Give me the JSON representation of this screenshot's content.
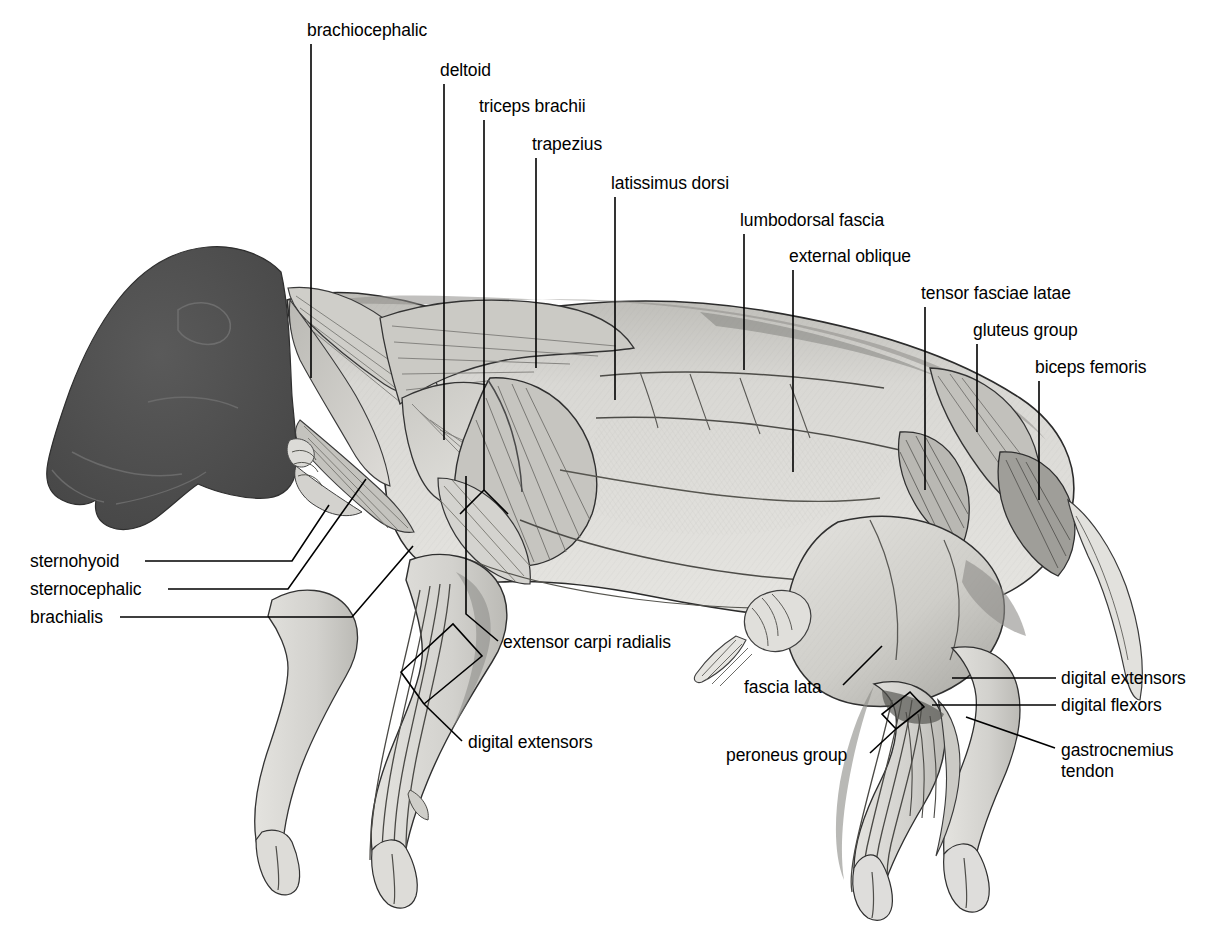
{
  "figure": {
    "kind": "anatomical-illustration",
    "background_color": "#ffffff",
    "ink_color": "#000000",
    "muscle_fill_color": "#d9d8d4",
    "muscle_shade_color": "#9a9894",
    "head_color": "#4e4e4e"
  },
  "labels": [
    {
      "id": "brachiocephalic",
      "text": "brachiocephalic",
      "x": 307,
      "y": 22,
      "leader": {
        "type": "vertical",
        "x": 311,
        "y1": 44,
        "y2": 378
      }
    },
    {
      "id": "deltoid",
      "text": "deltoid",
      "x": 440,
      "y": 62,
      "leader": {
        "type": "vertical",
        "x": 444,
        "y1": 84,
        "y2": 440
      }
    },
    {
      "id": "triceps-brachii",
      "text": "triceps brachii",
      "x": 479,
      "y": 98,
      "leader": {
        "type": "forked",
        "x": 484,
        "y1": 120,
        "y2": 490,
        "fork_dx": 20,
        "fork_dy": 22
      }
    },
    {
      "id": "trapezius",
      "text": "trapezius",
      "x": 532,
      "y": 136,
      "leader": {
        "type": "vertical",
        "x": 536,
        "y1": 158,
        "y2": 368
      }
    },
    {
      "id": "latissimus-dorsi",
      "text": "latissimus dorsi",
      "x": 611,
      "y": 175,
      "leader": {
        "type": "vertical",
        "x": 615,
        "y1": 197,
        "y2": 400
      }
    },
    {
      "id": "lumbodorsal-fascia",
      "text": "lumbodorsal fascia",
      "x": 740,
      "y": 212,
      "leader": {
        "type": "vertical",
        "x": 744,
        "y1": 234,
        "y2": 370
      }
    },
    {
      "id": "external-oblique",
      "text": "external oblique",
      "x": 789,
      "y": 248,
      "leader": {
        "type": "vertical",
        "x": 793,
        "y1": 270,
        "y2": 472
      }
    },
    {
      "id": "tensor-fasciae-latae",
      "text": "tensor fasciae latae",
      "x": 921,
      "y": 285,
      "leader": {
        "type": "vertical",
        "x": 925,
        "y1": 307,
        "y2": 490
      }
    },
    {
      "id": "gluteus-group",
      "text": "gluteus group",
      "x": 973,
      "y": 322,
      "leader": {
        "type": "vertical",
        "x": 977,
        "y1": 344,
        "y2": 432
      }
    },
    {
      "id": "biceps-femoris",
      "text": "biceps femoris",
      "x": 1035,
      "y": 359,
      "leader": {
        "type": "vertical",
        "x": 1039,
        "y1": 381,
        "y2": 500
      }
    },
    {
      "id": "sternohyoid",
      "text": "sternohyoid",
      "x": 30,
      "y": 553,
      "leader": {
        "type": "bent-right",
        "points": "145,561 292,561 329,505"
      }
    },
    {
      "id": "sternocephalic",
      "text": "sternocephalic",
      "x": 30,
      "y": 581,
      "leader": {
        "type": "bent-right",
        "points": "168,589 288,589 366,479"
      }
    },
    {
      "id": "brachialis",
      "text": "brachialis",
      "x": 30,
      "y": 609,
      "leader": {
        "type": "bent-right",
        "points": "120,617 352,617 413,546"
      }
    },
    {
      "id": "extensor-carpi-radialis",
      "text": "extensor carpi radialis",
      "x": 503,
      "y": 634,
      "leader": {
        "type": "diagonal",
        "points": "498,641 466,614 466,476"
      }
    },
    {
      "id": "digital-extensors-fore",
      "text": "digital extensors",
      "x": 468,
      "y": 734,
      "leader": {
        "type": "bracket",
        "points": "462,741 425,705 403,673 455,625 482,657 424,704"
      }
    },
    {
      "id": "fascia-lata",
      "text": "fascia lata",
      "x": 744,
      "y": 679,
      "leader": {
        "type": "diagonal",
        "points": "843,685 880,648"
      }
    },
    {
      "id": "peroneus-group",
      "text": "peroneus group",
      "x": 726,
      "y": 747,
      "leader": {
        "type": "bracket",
        "points": "870,753 895,729 884,717 910,694 922,707 895,730"
      }
    },
    {
      "id": "digital-extensors-hind",
      "text": "digital extensors",
      "x": 1061,
      "y": 670,
      "leader": {
        "type": "horizontal",
        "points": "1056,678 952,678"
      }
    },
    {
      "id": "digital-flexors",
      "text": "digital flexors",
      "x": 1061,
      "y": 697,
      "leader": {
        "type": "horizontal",
        "points": "1056,705 932,705"
      }
    },
    {
      "id": "gastrocnemius-tendon",
      "text": "gastrocnemius\ntendon",
      "x": 1061,
      "y": 740,
      "leader": {
        "type": "diagonal",
        "points": "1055,748 966,717"
      }
    }
  ]
}
